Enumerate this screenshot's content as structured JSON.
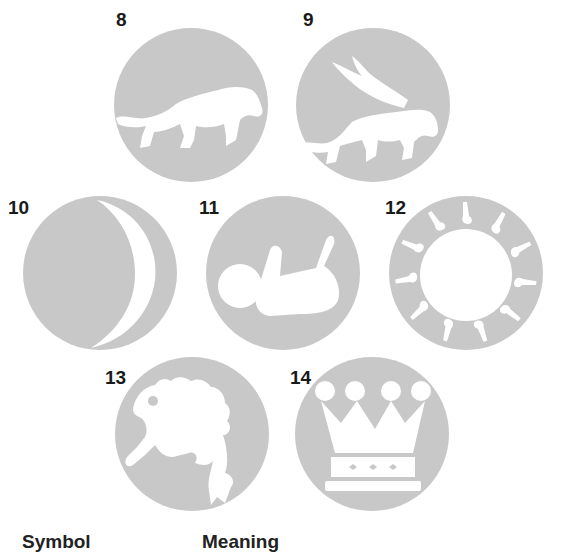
{
  "colors": {
    "disc": "#c8c8c8",
    "figure": "#ffffff",
    "text": "#1a1a1a"
  },
  "symbols": [
    {
      "number": "8",
      "icon": "lion-icon"
    },
    {
      "number": "9",
      "icon": "winged-lion-icon"
    },
    {
      "number": "10",
      "icon": "crescent-moon-icon"
    },
    {
      "number": "11",
      "icon": "ball-and-arm-icon"
    },
    {
      "number": "12",
      "icon": "sun-ring-icon"
    },
    {
      "number": "13",
      "icon": "frog-icon"
    },
    {
      "number": "14",
      "icon": "crown-icon"
    }
  ],
  "table_header": {
    "col1": "Symbol",
    "col2": "Meaning"
  }
}
